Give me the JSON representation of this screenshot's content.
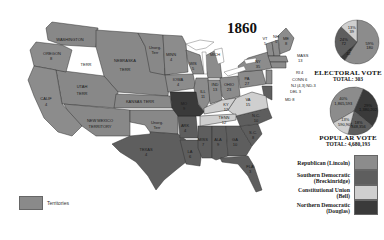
{
  "map": {
    "title": "1860",
    "state_labels": [
      {
        "name": "WASHINGTON",
        "x": 70,
        "y": 41
      },
      {
        "name": "OREGON",
        "x": 52,
        "y": 55
      },
      {
        "name": "8",
        "x": 51,
        "y": 60
      },
      {
        "name": "TERR",
        "x": 86,
        "y": 66
      },
      {
        "name": "NEBRASKA",
        "x": 125,
        "y": 62
      },
      {
        "name": "TERR",
        "x": 125,
        "y": 71
      },
      {
        "name": "Unorg.",
        "x": 155,
        "y": 49
      },
      {
        "name": "Terr",
        "x": 155,
        "y": 54
      },
      {
        "name": "MINN",
        "x": 171,
        "y": 56
      },
      {
        "name": "4",
        "x": 171,
        "y": 61
      },
      {
        "name": "WIS",
        "x": 193,
        "y": 65
      },
      {
        "name": "5",
        "x": 193,
        "y": 70
      },
      {
        "name": "MICH",
        "x": 215,
        "y": 56
      },
      {
        "name": "IOWA",
        "x": 178,
        "y": 81
      },
      {
        "name": "4",
        "x": 178,
        "y": 86
      },
      {
        "name": "UTAH",
        "x": 82,
        "y": 88
      },
      {
        "name": "TERR",
        "x": 82,
        "y": 95
      },
      {
        "name": "CALIF",
        "x": 46,
        "y": 100
      },
      {
        "name": "4",
        "x": 46,
        "y": 106
      },
      {
        "name": "KANSAS TERR",
        "x": 140,
        "y": 103
      },
      {
        "name": "MO",
        "x": 184,
        "y": 105
      },
      {
        "name": "9",
        "x": 184,
        "y": 110
      },
      {
        "name": "ILL",
        "x": 203,
        "y": 93
      },
      {
        "name": "11",
        "x": 203,
        "y": 98
      },
      {
        "name": "IND",
        "x": 215,
        "y": 86
      },
      {
        "name": "13",
        "x": 215,
        "y": 91
      },
      {
        "name": "OHIO",
        "x": 229,
        "y": 86
      },
      {
        "name": "23",
        "x": 229,
        "y": 91
      },
      {
        "name": "PA",
        "x": 247,
        "y": 80
      },
      {
        "name": "27",
        "x": 247,
        "y": 85
      },
      {
        "name": "NY",
        "x": 258,
        "y": 63
      },
      {
        "name": "35",
        "x": 258,
        "y": 68
      },
      {
        "name": "VT",
        "x": 265,
        "y": 40
      },
      {
        "name": "5",
        "x": 265,
        "y": 45
      },
      {
        "name": "NH",
        "x": 276,
        "y": 38
      },
      {
        "name": "5",
        "x": 276,
        "y": 43
      },
      {
        "name": "ME",
        "x": 286,
        "y": 40
      },
      {
        "name": "8",
        "x": 286,
        "y": 45
      },
      {
        "name": "KY",
        "x": 226,
        "y": 106
      },
      {
        "name": "12",
        "x": 226,
        "y": 111
      },
      {
        "name": "VA",
        "x": 248,
        "y": 101
      },
      {
        "name": "15",
        "x": 248,
        "y": 106
      },
      {
        "name": "TENN",
        "x": 224,
        "y": 119
      },
      {
        "name": "12",
        "x": 224,
        "y": 124
      },
      {
        "name": "N.C.",
        "x": 256,
        "y": 117
      },
      {
        "name": "10",
        "x": 256,
        "y": 122
      },
      {
        "name": "S.C.",
        "x": 253,
        "y": 134
      },
      {
        "name": "8",
        "x": 253,
        "y": 139
      },
      {
        "name": "NEW MEXICO",
        "x": 100,
        "y": 122
      },
      {
        "name": "TERRITORY",
        "x": 100,
        "y": 128
      },
      {
        "name": "Unorg.",
        "x": 157,
        "y": 124
      },
      {
        "name": "Terr",
        "x": 157,
        "y": 129
      },
      {
        "name": "ARK",
        "x": 185,
        "y": 127
      },
      {
        "name": "4",
        "x": 185,
        "y": 132
      },
      {
        "name": "TEXAS",
        "x": 146,
        "y": 151
      },
      {
        "name": "4",
        "x": 146,
        "y": 156
      },
      {
        "name": "LA",
        "x": 190,
        "y": 153
      },
      {
        "name": "6",
        "x": 190,
        "y": 158
      },
      {
        "name": "MISS",
        "x": 203,
        "y": 141
      },
      {
        "name": "7",
        "x": 203,
        "y": 146
      },
      {
        "name": "ALA",
        "x": 218,
        "y": 141
      },
      {
        "name": "9",
        "x": 218,
        "y": 146
      },
      {
        "name": "GA",
        "x": 235,
        "y": 141
      },
      {
        "name": "10",
        "x": 235,
        "y": 146
      },
      {
        "name": "FLA",
        "x": 250,
        "y": 168
      },
      {
        "name": "3",
        "x": 250,
        "y": 173
      }
    ],
    "callouts": [
      {
        "text": "MASS",
        "x": 297,
        "y": 57
      },
      {
        "text": "13",
        "x": 298,
        "y": 62
      },
      {
        "text": "RI 4",
        "x": 296,
        "y": 74
      },
      {
        "text": "CONN 6",
        "x": 292,
        "y": 81
      },
      {
        "text": "NJ (4,3) ND-3",
        "x": 291,
        "y": 87
      },
      {
        "text": "DEL 3",
        "x": 290,
        "y": 93
      },
      {
        "text": "MD 8",
        "x": 285,
        "y": 101
      }
    ]
  },
  "electoral_vote": {
    "heading": "ELECTORAL VOTE",
    "total_label": "TOTAL: 303",
    "slices": [
      {
        "party": "Republican (Lincoln)",
        "pct": "59%",
        "votes": "180",
        "value": 180
      },
      {
        "party": "Northern Democratic (Douglas)",
        "pct": "4%",
        "votes": "12",
        "value": 12
      },
      {
        "party": "Southern Democratic (Breckinridge)",
        "pct": "24%",
        "votes": "72",
        "value": 72
      },
      {
        "party": "Constitutional Union (Bell)",
        "pct": "13%",
        "votes": "39",
        "value": 39
      }
    ]
  },
  "popular_vote": {
    "heading": "POPULAR VOTE",
    "total_label": "TOTAL: 4,680,193",
    "slices": [
      {
        "party": "Republican (Lincoln)",
        "pct": "40%",
        "votes": "1,865,593",
        "value": 1865593
      },
      {
        "party": "Northern Democratic (Douglas)",
        "pct": "29%",
        "votes": "1,380,202",
        "value": 1380202
      },
      {
        "party": "Southern Democratic (Breckinridge)",
        "pct": "18%",
        "votes": "848,356",
        "value": 848356
      },
      {
        "party": "Constitutional Union (Bell)",
        "pct": "13%",
        "votes": "590,901",
        "value": 590901
      }
    ]
  },
  "legend": {
    "items": [
      {
        "label_line1": "Republican (Lincoln)",
        "label_line2": "",
        "color": "#8c8c8c"
      },
      {
        "label_line1": "Southern Democratic",
        "label_line2": "(Breckinridge)",
        "color": "#5e5e5e"
      },
      {
        "label_line1": "Constitutional Union",
        "label_line2": "(Bell)",
        "color": "#cfcfcf"
      },
      {
        "label_line1": "Northern Democratic",
        "label_line2": "(Douglas)",
        "color": "#3a3a3a"
      }
    ],
    "territories": {
      "label": "Territories",
      "color": "#8a8a8a"
    }
  },
  "colors": {
    "republican": "#8c8c8c",
    "southern_democratic": "#5e5e5e",
    "constitutional_union": "#cfcfcf",
    "northern_democratic": "#3a3a3a",
    "territory": "#888888",
    "state_border": "#333333",
    "water": "#ffffff"
  }
}
